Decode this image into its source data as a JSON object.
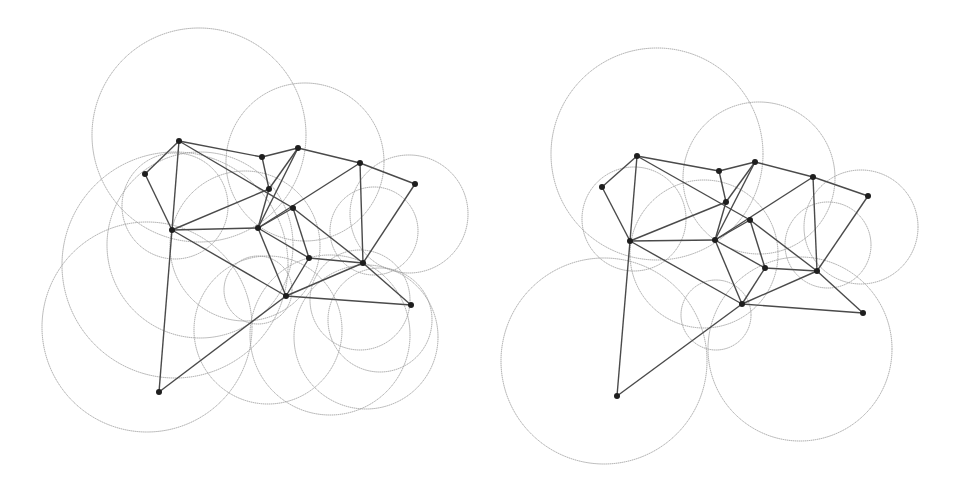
{
  "colors": {
    "background": "#ffffff",
    "circle_stroke": "#9a9a9a",
    "edge_stroke": "#4a4a4a",
    "node_fill": "#1e1e1e"
  },
  "diagrams": [
    {
      "name": "left-graph",
      "nodes": [
        {
          "id": "A",
          "x": 179,
          "y": 141
        },
        {
          "id": "B",
          "x": 145,
          "y": 174
        },
        {
          "id": "C",
          "x": 262,
          "y": 157
        },
        {
          "id": "D",
          "x": 298,
          "y": 148
        },
        {
          "id": "E",
          "x": 360,
          "y": 163
        },
        {
          "id": "F",
          "x": 415,
          "y": 184
        },
        {
          "id": "G",
          "x": 269,
          "y": 189
        },
        {
          "id": "H",
          "x": 293,
          "y": 208
        },
        {
          "id": "I",
          "x": 172,
          "y": 230
        },
        {
          "id": "J",
          "x": 258,
          "y": 228
        },
        {
          "id": "K",
          "x": 309,
          "y": 258
        },
        {
          "id": "L",
          "x": 363,
          "y": 263
        },
        {
          "id": "M",
          "x": 286,
          "y": 296
        },
        {
          "id": "N",
          "x": 411,
          "y": 305
        },
        {
          "id": "O",
          "x": 159,
          "y": 392
        }
      ],
      "edges": [
        [
          "A",
          "B"
        ],
        [
          "A",
          "C"
        ],
        [
          "C",
          "D"
        ],
        [
          "D",
          "E"
        ],
        [
          "E",
          "F"
        ],
        [
          "A",
          "I"
        ],
        [
          "B",
          "I"
        ],
        [
          "A",
          "H"
        ],
        [
          "C",
          "G"
        ],
        [
          "D",
          "G"
        ],
        [
          "D",
          "J"
        ],
        [
          "G",
          "I"
        ],
        [
          "I",
          "J"
        ],
        [
          "I",
          "M"
        ],
        [
          "G",
          "J"
        ],
        [
          "J",
          "H"
        ],
        [
          "J",
          "K"
        ],
        [
          "J",
          "M"
        ],
        [
          "H",
          "K"
        ],
        [
          "H",
          "L"
        ],
        [
          "E",
          "J"
        ],
        [
          "E",
          "L"
        ],
        [
          "F",
          "L"
        ],
        [
          "K",
          "L"
        ],
        [
          "K",
          "M"
        ],
        [
          "L",
          "N"
        ],
        [
          "L",
          "M"
        ],
        [
          "M",
          "N"
        ],
        [
          "I",
          "O"
        ],
        [
          "M",
          "O"
        ]
      ],
      "circles": [
        {
          "cx": 199,
          "cy": 135,
          "r": 107
        },
        {
          "cx": 305,
          "cy": 162,
          "r": 79
        },
        {
          "cx": 409,
          "cy": 214,
          "r": 59
        },
        {
          "cx": 374,
          "cy": 231,
          "r": 44
        },
        {
          "cx": 175,
          "cy": 206,
          "r": 53
        },
        {
          "cx": 175,
          "cy": 265,
          "r": 113
        },
        {
          "cx": 147,
          "cy": 327,
          "r": 105
        },
        {
          "cx": 200,
          "cy": 245,
          "r": 93
        },
        {
          "cx": 245,
          "cy": 246,
          "r": 75
        },
        {
          "cx": 258,
          "cy": 290,
          "r": 34
        },
        {
          "cx": 268,
          "cy": 330,
          "r": 74
        },
        {
          "cx": 330,
          "cy": 335,
          "r": 80
        },
        {
          "cx": 366,
          "cy": 337,
          "r": 72
        },
        {
          "cx": 380,
          "cy": 320,
          "r": 52
        },
        {
          "cx": 360,
          "cy": 300,
          "r": 50
        }
      ]
    },
    {
      "name": "right-graph",
      "nodes": [
        {
          "id": "A",
          "x": 637,
          "y": 156
        },
        {
          "id": "B",
          "x": 602,
          "y": 187
        },
        {
          "id": "C",
          "x": 719,
          "y": 171
        },
        {
          "id": "D",
          "x": 755,
          "y": 162
        },
        {
          "id": "E",
          "x": 813,
          "y": 177
        },
        {
          "id": "F",
          "x": 868,
          "y": 196
        },
        {
          "id": "G",
          "x": 726,
          "y": 202
        },
        {
          "id": "H",
          "x": 750,
          "y": 220
        },
        {
          "id": "I",
          "x": 630,
          "y": 241
        },
        {
          "id": "J",
          "x": 715,
          "y": 240
        },
        {
          "id": "K",
          "x": 765,
          "y": 268
        },
        {
          "id": "L",
          "x": 817,
          "y": 271
        },
        {
          "id": "M",
          "x": 742,
          "y": 304
        },
        {
          "id": "N",
          "x": 863,
          "y": 313
        },
        {
          "id": "O",
          "x": 617,
          "y": 396
        }
      ],
      "edges": [
        [
          "A",
          "B"
        ],
        [
          "A",
          "C"
        ],
        [
          "C",
          "D"
        ],
        [
          "D",
          "E"
        ],
        [
          "E",
          "F"
        ],
        [
          "A",
          "I"
        ],
        [
          "B",
          "I"
        ],
        [
          "A",
          "H"
        ],
        [
          "C",
          "G"
        ],
        [
          "D",
          "G"
        ],
        [
          "D",
          "J"
        ],
        [
          "G",
          "I"
        ],
        [
          "I",
          "J"
        ],
        [
          "I",
          "M"
        ],
        [
          "G",
          "J"
        ],
        [
          "J",
          "H"
        ],
        [
          "J",
          "K"
        ],
        [
          "J",
          "M"
        ],
        [
          "H",
          "K"
        ],
        [
          "H",
          "L"
        ],
        [
          "E",
          "J"
        ],
        [
          "E",
          "L"
        ],
        [
          "F",
          "L"
        ],
        [
          "K",
          "L"
        ],
        [
          "K",
          "M"
        ],
        [
          "L",
          "N"
        ],
        [
          "L",
          "M"
        ],
        [
          "M",
          "N"
        ],
        [
          "I",
          "O"
        ],
        [
          "M",
          "O"
        ]
      ],
      "circles": [
        {
          "cx": 657,
          "cy": 154,
          "r": 106
        },
        {
          "cx": 759,
          "cy": 178,
          "r": 76
        },
        {
          "cx": 861,
          "cy": 227,
          "r": 57
        },
        {
          "cx": 828,
          "cy": 245,
          "r": 43
        },
        {
          "cx": 634,
          "cy": 219,
          "r": 52
        },
        {
          "cx": 704,
          "cy": 254,
          "r": 74
        },
        {
          "cx": 716,
          "cy": 315,
          "r": 35
        },
        {
          "cx": 604,
          "cy": 361,
          "r": 103
        },
        {
          "cx": 800,
          "cy": 349,
          "r": 92
        }
      ]
    }
  ]
}
